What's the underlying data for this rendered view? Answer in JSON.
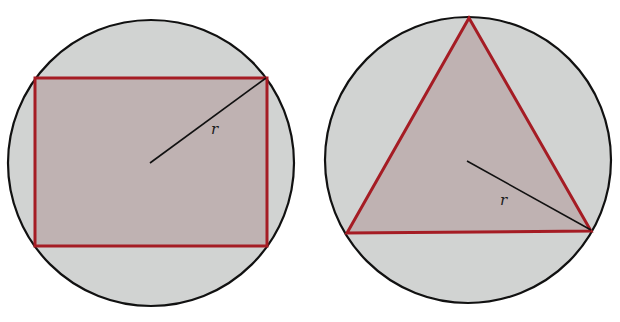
{
  "figures": [
    {
      "name": "rectangle-inscribed-in-circle",
      "circle": {
        "cx": 151,
        "cy": 163,
        "r": 143
      },
      "shape": {
        "type": "rectangle",
        "x": 35,
        "y": 78,
        "width": 232,
        "height": 168
      },
      "radius_line": {
        "x1": 150,
        "y1": 163,
        "x2": 266,
        "y2": 78
      },
      "radius_label": {
        "text": "r",
        "x": 211,
        "y": 134
      }
    },
    {
      "name": "triangle-inscribed-in-circle",
      "circle": {
        "cx": 468,
        "cy": 160,
        "r": 143
      },
      "shape": {
        "type": "triangle",
        "points": "469,18 347,233 591,231"
      },
      "radius_line": {
        "x1": 467,
        "y1": 161,
        "x2": 591,
        "y2": 230
      },
      "radius_label": {
        "text": "r",
        "x": 500,
        "y": 205
      }
    }
  ],
  "colors": {
    "circle_fill": "#d1d3d2",
    "circle_stroke": "#111111",
    "shape_fill": "#bfb2b2",
    "shape_stroke": "#a51c24",
    "radius_line": "#111111"
  }
}
